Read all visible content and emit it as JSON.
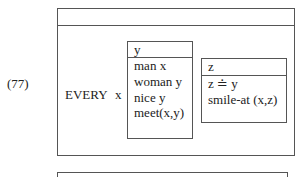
{
  "example_number": "(77)",
  "drs": {
    "outer_box": {
      "universe": "",
      "quantifier": "EVERY",
      "quantifier_variable": "x"
    },
    "antecedent_box": {
      "universe": "y",
      "conditions": [
        "man x",
        "woman y",
        "nice y",
        "meet(x,y)"
      ]
    },
    "consequent_box": {
      "universe": "z",
      "conditions": [
        "z ≐ y",
        "smile-at (x,z)"
      ]
    },
    "next_box": {
      "universe": ""
    }
  },
  "colors": {
    "line": "#555555",
    "text": "#222222",
    "background": "#ffffff"
  }
}
